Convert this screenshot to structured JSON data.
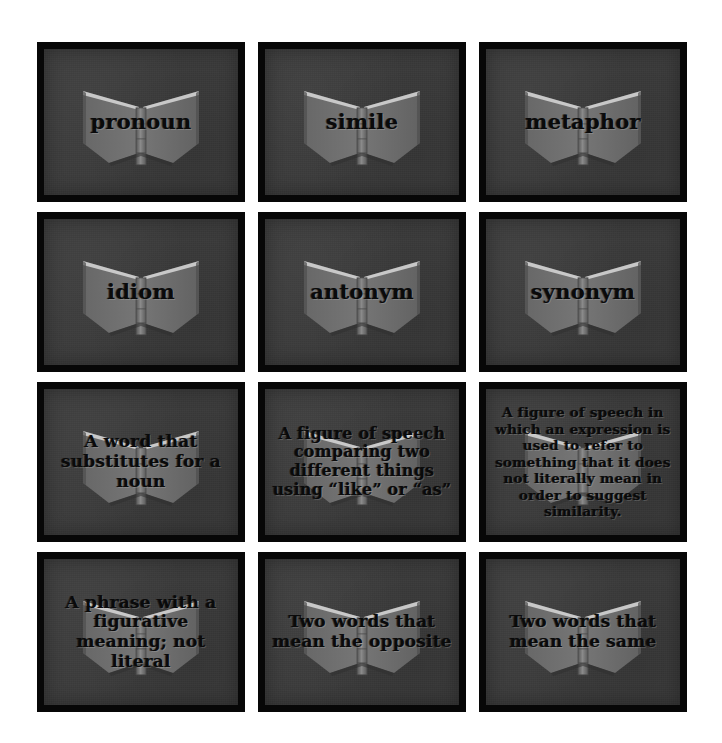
{
  "page": {
    "background_color": "#ffffff"
  },
  "style": {
    "card_background": "#3b3b3b",
    "card_border": "#070707",
    "text_color": "#0a0a0a",
    "book_icon_color": "#6f6f6f",
    "book_icon_name": "open-book-icon"
  },
  "grid": {
    "columns": 3,
    "rows": 4,
    "total_cards": 12
  },
  "cards": [
    {
      "id": "pronoun-term",
      "type": "term",
      "size": "term",
      "text": "pronoun"
    },
    {
      "id": "simile-term",
      "type": "term",
      "size": "term",
      "text": "simile"
    },
    {
      "id": "metaphor-term",
      "type": "term",
      "size": "term",
      "text": "metaphor"
    },
    {
      "id": "idiom-term",
      "type": "term",
      "size": "term",
      "text": "idiom"
    },
    {
      "id": "antonym-term",
      "type": "term",
      "size": "term",
      "text": "antonym"
    },
    {
      "id": "synonym-term",
      "type": "term",
      "size": "term",
      "text": "synonym"
    },
    {
      "id": "pronoun-definition",
      "type": "definition",
      "size": "def-short",
      "text": "A word that substitutes for a noun"
    },
    {
      "id": "simile-definition",
      "type": "definition",
      "size": "def-med",
      "text": "A figure of speech comparing two different things using “like” or “as”"
    },
    {
      "id": "metaphor-definition",
      "type": "definition",
      "size": "def-long",
      "text": "A figure of speech in which an expression is used to refer to something that it does not literally mean in order to suggest similarity."
    },
    {
      "id": "idiom-definition",
      "type": "definition",
      "size": "def-short",
      "text": "A phrase with a figurative meaning; not literal"
    },
    {
      "id": "antonym-definition",
      "type": "definition",
      "size": "def-short",
      "text": "Two words that mean the opposite"
    },
    {
      "id": "synonym-definition",
      "type": "definition",
      "size": "def-short",
      "text": "Two words that mean the same"
    }
  ]
}
